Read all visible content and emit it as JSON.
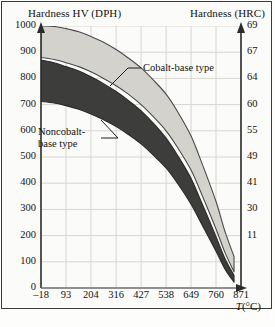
{
  "figure": {
    "left_axis_title": "Hardness HV (DPH)",
    "right_axis_title": "Hardness (HRC)",
    "x_axis_title_symbol": "T",
    "x_axis_title_unit": "(°C)"
  },
  "annotations": {
    "cobalt": "Cobalt-base type",
    "noncobalt_line1": "Noncobalt-",
    "noncobalt_line2": "base type"
  },
  "chart_data": {
    "type": "area",
    "title": "",
    "subtitle": "",
    "xlabel": "T(°C)",
    "ylabel": "Hardness HV (DPH)",
    "ylabel_secondary": "Hardness (HRC)",
    "grid": true,
    "legend": "inline-annotations",
    "xlim": [
      -18,
      871
    ],
    "ylim": [
      0,
      1000
    ],
    "xticks": [
      -18,
      93,
      204,
      316,
      427,
      538,
      649,
      760,
      871
    ],
    "xticklabels": [
      "–18",
      "93",
      "204",
      "316",
      "427",
      "538",
      "649",
      "760",
      "871"
    ],
    "yticks": [
      0,
      100,
      200,
      300,
      400,
      500,
      600,
      700,
      800,
      900,
      1000
    ],
    "yticklabels": [
      "0",
      "100",
      "200",
      "300",
      "400",
      "500",
      "600",
      "700",
      "800",
      "900",
      "1000"
    ],
    "yticks_secondary_at_hv": [
      200,
      300,
      400,
      500,
      600,
      700,
      800,
      900,
      1000
    ],
    "yticklabels_secondary": [
      "11",
      "30",
      "41",
      "49",
      "55",
      "60",
      "64",
      "67",
      "69"
    ],
    "series": [
      {
        "name": "Cobalt-base type",
        "fill": "#d4d2cd",
        "edge": "#4a4a48",
        "x": [
          -18,
          40,
          93,
          150,
          204,
          260,
          316,
          370,
          427,
          480,
          538,
          590,
          649,
          700,
          760,
          800,
          840
        ],
        "upper": [
          1000,
          998,
          990,
          978,
          960,
          938,
          910,
          878,
          840,
          795,
          740,
          672,
          580,
          470,
          330,
          215,
          120
        ],
        "lower": [
          880,
          872,
          860,
          845,
          825,
          800,
          772,
          740,
          700,
          655,
          600,
          535,
          450,
          350,
          225,
          135,
          62
        ]
      },
      {
        "name": "Noncobalt-base type",
        "fill": "#3d3d3b",
        "edge": "#2a2a28",
        "x": [
          -18,
          40,
          93,
          150,
          204,
          260,
          316,
          370,
          427,
          480,
          538,
          590,
          649,
          700,
          760,
          800,
          840
        ],
        "upper": [
          870,
          860,
          845,
          828,
          806,
          780,
          750,
          716,
          676,
          630,
          572,
          505,
          418,
          318,
          196,
          112,
          48
        ],
        "lower": [
          712,
          706,
          696,
          682,
          664,
          642,
          616,
          586,
          550,
          508,
          458,
          398,
          320,
          238,
          140,
          72,
          22
        ]
      }
    ]
  }
}
